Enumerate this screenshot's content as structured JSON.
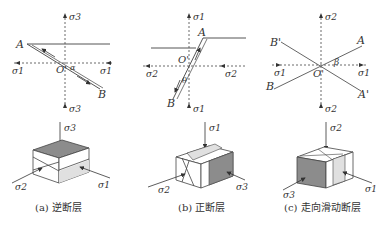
{
  "figure": {
    "panels": [
      {
        "id": "a",
        "caption": "(a) 逆断层",
        "axis_vertical_label": "σ3",
        "axis_horizontal_label": "σ1",
        "points": {
          "A": "A",
          "B": "B",
          "O": "O'"
        },
        "angle_label": "α",
        "block": {
          "top_label": "σ3",
          "left_label": "σ2",
          "right_label": "σ1"
        }
      },
      {
        "id": "b",
        "caption": "(b) 正断层",
        "axis_vertical_label": "σ1",
        "axis_horizontal_label": "σ2",
        "points": {
          "A": "A",
          "B": "B",
          "O": "O'"
        },
        "angle_label": "θ",
        "block": {
          "top_label": "σ1",
          "left_label": "σ2",
          "right_label": "σ3"
        }
      },
      {
        "id": "c",
        "caption": "(c) 走向滑动断层",
        "axis_vertical_label": "σ2",
        "axis_horizontal_label": "σ1",
        "points": {
          "A": "A",
          "B": "B",
          "A2": "A'",
          "B2": "B'",
          "O": "O'"
        },
        "angle_label": "β",
        "block": {
          "top_label": "σ2",
          "left_label": "σ3",
          "right_label": "σ1"
        }
      }
    ]
  },
  "colors": {
    "line": "#555555",
    "dark_face": "#8c8c8c",
    "light_face": "#e0e0e0"
  }
}
